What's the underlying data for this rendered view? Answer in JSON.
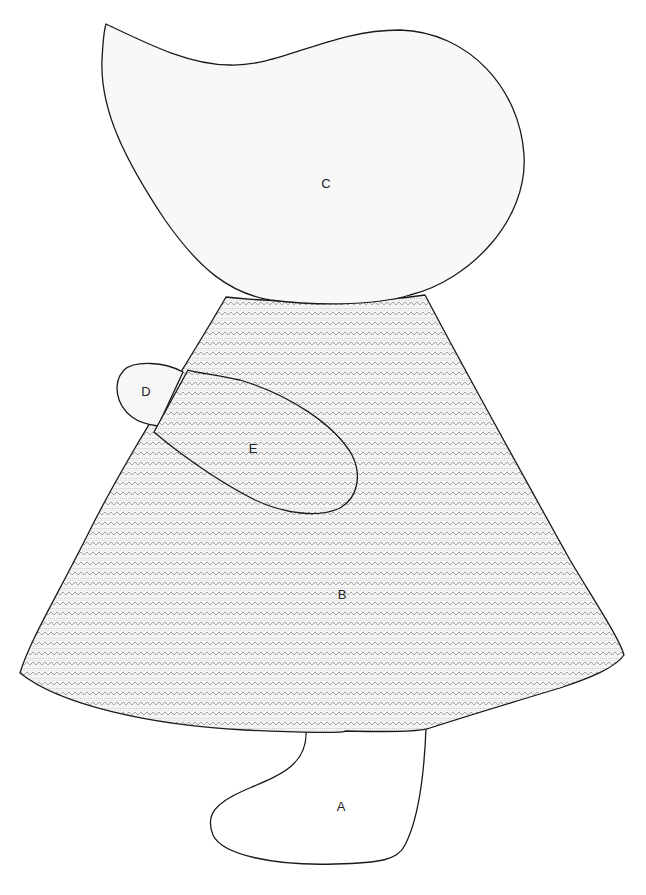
{
  "diagram": {
    "pieces": [
      {
        "id": "A",
        "name": "shoe",
        "fill": "#ffffff",
        "patterned": false
      },
      {
        "id": "B",
        "name": "dress",
        "fill": "pattern",
        "patterned": true
      },
      {
        "id": "C",
        "name": "bonnet",
        "fill": "#f8f8f8",
        "patterned": false
      },
      {
        "id": "D",
        "name": "hand",
        "fill": "#f7f7f7",
        "patterned": false
      },
      {
        "id": "E",
        "name": "sleeve",
        "fill": "pattern",
        "patterned": true
      }
    ],
    "labels": {
      "a": "A",
      "b": "B",
      "c": "C",
      "d": "D",
      "e": "E"
    },
    "colors": {
      "outline": "#1a1a1a",
      "pattern_line": "#9a9a9a",
      "pattern_dot": "#b5b5b5",
      "background": "#ffffff"
    }
  }
}
